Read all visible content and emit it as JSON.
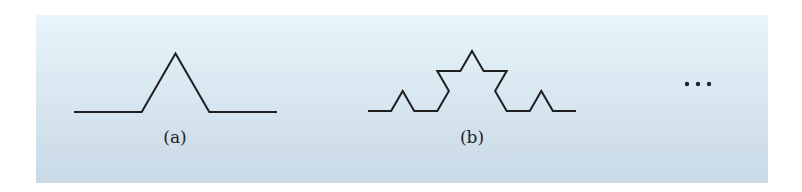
{
  "figure": {
    "background_gradient": [
      "#e8f5fa",
      "#c9d9e6"
    ],
    "stroke_color": "#1f1f1f",
    "panels": [
      {
        "id": "a",
        "label": "(a)",
        "iteration": 1
      },
      {
        "id": "b",
        "label": "(b)",
        "iteration": 2
      }
    ],
    "continuation": {
      "symbol": "...",
      "dot_count": 3
    }
  }
}
